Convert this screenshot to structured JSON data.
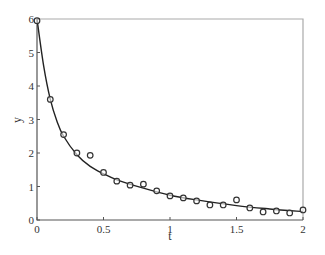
{
  "chart_data": {
    "type": "scatter",
    "title": "",
    "xlabel": "t",
    "ylabel": "y",
    "xlim": [
      0,
      2
    ],
    "ylim": [
      0,
      6
    ],
    "xticks": [
      0,
      0.5,
      1,
      1.5,
      2
    ],
    "xtick_labels": [
      "0",
      "0.5",
      "1",
      "1.5",
      "2"
    ],
    "yticks": [
      0,
      1,
      2,
      3,
      4,
      5,
      6
    ],
    "ytick_labels": [
      "0",
      "1",
      "2",
      "3",
      "4",
      "5",
      "6"
    ],
    "grid": false,
    "legend": null,
    "series": [
      {
        "name": "observations",
        "type": "scatter",
        "marker": "open-circle",
        "x": [
          0,
          0.1,
          0.2,
          0.3,
          0.4,
          0.5,
          0.6,
          0.7,
          0.8,
          0.9,
          1.0,
          1.1,
          1.2,
          1.3,
          1.4,
          1.5,
          1.6,
          1.7,
          1.8,
          1.9,
          2.0
        ],
        "y": [
          5.95,
          3.6,
          2.55,
          2.0,
          1.93,
          1.42,
          1.16,
          1.04,
          1.07,
          0.87,
          0.72,
          0.66,
          0.57,
          0.45,
          0.45,
          0.6,
          0.36,
          0.24,
          0.27,
          0.21,
          0.3
        ]
      },
      {
        "name": "fitted curve",
        "type": "line",
        "x": [
          0,
          0.05,
          0.1,
          0.15,
          0.2,
          0.3,
          0.4,
          0.5,
          0.6,
          0.8,
          1.0,
          1.2,
          1.5,
          1.75,
          2.0
        ],
        "y": [
          6.0,
          4.6,
          3.6,
          2.95,
          2.5,
          1.95,
          1.6,
          1.38,
          1.2,
          0.95,
          0.74,
          0.6,
          0.43,
          0.33,
          0.25
        ]
      }
    ]
  },
  "layout": {
    "plot_left": 37,
    "plot_right": 303,
    "plot_top": 19,
    "plot_bottom": 220,
    "axis_color": "#555555",
    "frame_color": "#aaaaaa",
    "line_color": "#222222",
    "marker_color": "#333333"
  }
}
